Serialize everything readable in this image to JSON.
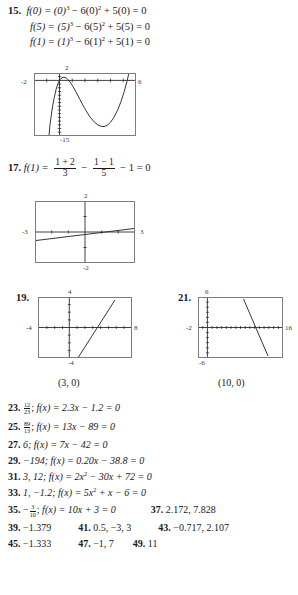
{
  "page": {
    "items": {
      "i15": {
        "number": "15.",
        "line1": "f(0) = (0)3 − 6(0)2 + 5(0) = 0",
        "line2": "f(5) = (5)3 − 6(5)2 + 5(5) = 0",
        "line3": "f(1) = (1)3 − 6(1)2 + 5(1) = 0",
        "l1_pre": "f(0) = (0)",
        "l1_mid": " − 6(0)",
        "l1_end": " + 5(0) = 0",
        "l2_pre": "f(5) = (5)",
        "l2_mid": " − 6(5)",
        "l2_end": " + 5(5) = 0",
        "l3_pre": "f(1) = (1)",
        "l3_mid": " − 6(1)",
        "l3_end": " + 5(1) = 0",
        "exp3": "3",
        "exp2": "2"
      },
      "i17": {
        "number": "17.",
        "lead": "f(1) = ",
        "frac1_top": "1 + 2",
        "frac1_bot": "3",
        "minus1": "−",
        "frac2_top": "1 − 1",
        "frac2_bot": "5",
        "tail": "− 1 = 0"
      },
      "i19": {
        "number": "19.",
        "answer": "(3, 0)"
      },
      "i21": {
        "number": "21.",
        "answer": "(10, 0)"
      }
    },
    "graphs": {
      "g15": {
        "name": "cubic-graph",
        "xmin_label": "-2",
        "xmax_label": "6",
        "ymax_label": "2",
        "ymin_label": "-15",
        "xmin": -2,
        "xmax": 6,
        "ymin": -15,
        "ymax": 2,
        "curve": "y = x^3 - 6x^2 + 5x"
      },
      "g17": {
        "name": "shallow-line-graph",
        "xmin_label": "-3",
        "xmax_label": "3",
        "ymax_label": "2",
        "ymin_label": "-2",
        "xmin": -3,
        "xmax": 3,
        "ymin": -2,
        "ymax": 2
      },
      "g19": {
        "name": "increasing-line-graph",
        "xmin_label": "-4",
        "xmax_label": "8",
        "ymax_label": "4",
        "ymin_label": "-4",
        "xmin": -4,
        "xmax": 8,
        "ymin": -4,
        "ymax": 4
      },
      "g21": {
        "name": "decreasing-line-graph",
        "xmin_label": "-2",
        "xmax_label": "16",
        "ymax_label": "6",
        "ymin_label": "-6",
        "xmin": -2,
        "xmax": 16,
        "ymin": -6,
        "ymax": 6
      }
    },
    "answers": {
      "r23": {
        "number": "23.",
        "frac_top": "12",
        "frac_bot": "23",
        "sep": "; ",
        "pre": "f(x) = 2.3x − 1.2 = 0"
      },
      "r25": {
        "number": "25.",
        "frac_top": "89",
        "frac_bot": "13",
        "sep": "; ",
        "pre": "f(x) = 13x − 89 = 0"
      },
      "r27": {
        "number": "27.",
        "text": "6; f(x) = 7x − 42 = 0"
      },
      "r29": {
        "number": "29.",
        "text": "−194; f(x) = 0.20x − 38.8 = 0"
      },
      "r31": {
        "number": "31.",
        "pre": "3, 12; f(x) = 2x",
        "exp": "2",
        "post": " − 30x + 72 = 0"
      },
      "r33": {
        "number": "33.",
        "pre": "1, −1.2; f(x) = 5x",
        "exp": "2",
        "post": " + x − 6 = 0"
      },
      "r35": {
        "number": "35.",
        "minus": "−",
        "frac_top": "3",
        "frac_bot": "10",
        "sep": "; ",
        "post": "f(x) = 10x + 3 = 0"
      },
      "r37": {
        "number": "37.",
        "text": "2.172, 7.828"
      },
      "r39": {
        "number": "39.",
        "text": "−1.379"
      },
      "r41": {
        "number": "41.",
        "text": "0.5, −3, 3"
      },
      "r43": {
        "number": "43.",
        "text": "−0.717, 2.107"
      },
      "r45": {
        "number": "45.",
        "text": "−1.333"
      },
      "r47": {
        "number": "47.",
        "text": "−1, 7"
      },
      "r49": {
        "number": "49.",
        "text": "11"
      }
    }
  }
}
